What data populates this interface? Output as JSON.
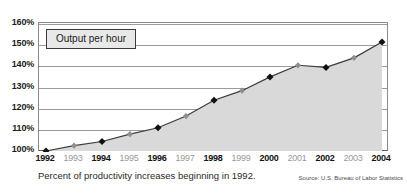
{
  "chart_data": {
    "type": "line",
    "title": "",
    "legend_label": "Output per hour",
    "legend_position": "top-left-inside",
    "grid": true,
    "xlabel": "",
    "ylabel": "",
    "ylim": [
      100,
      160
    ],
    "yticks": [
      "100%",
      "110%",
      "120%",
      "130%",
      "140%",
      "150%",
      "160%"
    ],
    "ytick_values": [
      100,
      110,
      120,
      130,
      140,
      150,
      160
    ],
    "categories": [
      "1992",
      "1993",
      "1994",
      "1995",
      "1996",
      "1997",
      "1998",
      "1999",
      "2000",
      "2001",
      "2002",
      "2003",
      "2004"
    ],
    "series": [
      {
        "name": "Output per hour",
        "values": [
          100,
          102.5,
          104.5,
          108,
          111,
          116.5,
          124,
          128.5,
          135,
          140.5,
          139.5,
          144,
          151.5
        ]
      }
    ],
    "caption": "Percent of productivity increases beginning in 1992.",
    "source": "Source: U.S. Bureau of Labor Statistics",
    "colors": {
      "line": "#3a3a3a",
      "area_fill": "#d9d9d9",
      "marker_major": "#111111",
      "marker_minor": "#8f8f8f",
      "gridline": "#9a9a9a",
      "axis": "#5a5a5a",
      "legend_bg": "#e8e8e8",
      "legend_border": "#3a3a3a",
      "background": "#ffffff"
    },
    "emphasized_categories": [
      "1992",
      "1994",
      "1996",
      "1998",
      "2000",
      "2002",
      "2004"
    ]
  }
}
